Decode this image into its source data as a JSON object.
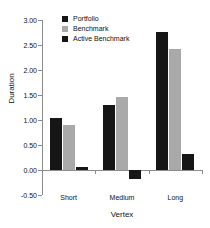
{
  "chart_data": {
    "type": "bar",
    "title": "",
    "xlabel": "Vertex",
    "ylabel": "Duration",
    "categories": [
      "Short",
      "Medium",
      "Long"
    ],
    "series": [
      {
        "name": "Portfolio",
        "color": "#161616",
        "values": [
          1.05,
          1.3,
          2.77
        ]
      },
      {
        "name": "Benchmark",
        "color": "#a9a9a9",
        "values": [
          0.9,
          1.47,
          2.43
        ]
      },
      {
        "name": "Active Benchmark",
        "color": "#161616",
        "values": [
          0.07,
          -0.17,
          0.33
        ]
      }
    ],
    "ylim": [
      -0.5,
      3.0
    ],
    "yticks": [
      "3.00",
      "2.50",
      "2.00",
      "1.50",
      "1.00",
      "0.50",
      "0.00",
      "-0.50"
    ],
    "ytick_values": [
      3.0,
      2.5,
      2.0,
      1.5,
      1.0,
      0.5,
      0.0,
      -0.5
    ],
    "grid": false,
    "legend_position": "top-left",
    "axis_color": "#8c8c8c"
  }
}
